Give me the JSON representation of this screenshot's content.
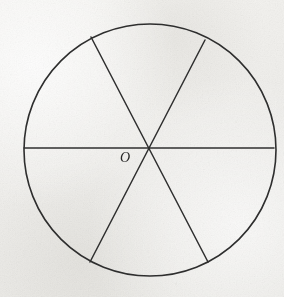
{
  "figure": {
    "kind": "geometry-diagram",
    "background_color": "#f1f0ec",
    "stroke_color": "#2e2e2e",
    "label_color": "#262626",
    "canvas": {
      "width": 284,
      "height": 297
    }
  },
  "circle": {
    "name": "main-circle",
    "center_x": 150,
    "center_y": 150,
    "radius": 126,
    "stroke_width": 1.6
  },
  "center_point": {
    "label": "O",
    "x": 150,
    "y": 148,
    "label_x": 120,
    "label_y": 151
  },
  "diameters": [
    {
      "name": "horizontal-diameter",
      "x1": 24,
      "y1": 148,
      "x2": 274,
      "y2": 148
    },
    {
      "name": "diagonal-diameter-nw-se",
      "x1": 91,
      "y1": 37,
      "x2": 208,
      "y2": 262
    },
    {
      "name": "diagonal-diameter-ne-sw",
      "x1": 205,
      "y1": 40,
      "x2": 90,
      "y2": 262
    }
  ],
  "sectors": {
    "count": 6,
    "labels": []
  }
}
